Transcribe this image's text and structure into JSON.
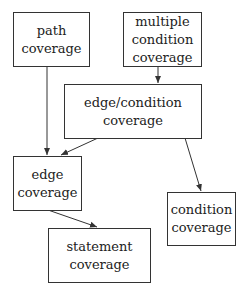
{
  "diagram": {
    "nodes": [
      {
        "id": "path",
        "lines": [
          "path",
          "coverage"
        ]
      },
      {
        "id": "multiple",
        "lines": [
          "multiple",
          "condition",
          "coverage"
        ]
      },
      {
        "id": "edgecond",
        "lines": [
          "edge/condition",
          "coverage"
        ]
      },
      {
        "id": "edge",
        "lines": [
          "edge",
          "coverage"
        ]
      },
      {
        "id": "condition",
        "lines": [
          "condition",
          "coverage"
        ]
      },
      {
        "id": "statement",
        "lines": [
          "statement",
          "coverage"
        ]
      }
    ],
    "edges": [
      {
        "from": "path",
        "to": "edge"
      },
      {
        "from": "multiple",
        "to": "edgecond"
      },
      {
        "from": "edgecond",
        "to": "edge"
      },
      {
        "from": "edgecond",
        "to": "condition"
      },
      {
        "from": "edge",
        "to": "statement"
      }
    ]
  }
}
